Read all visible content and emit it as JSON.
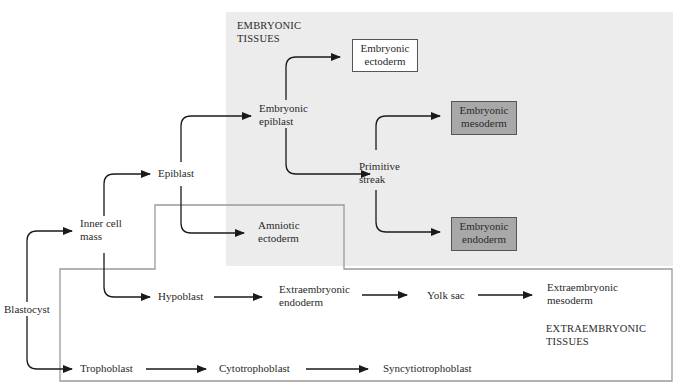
{
  "regions": {
    "embryonic": {
      "title_line1": "EMBRYONIC",
      "title_line2": "TISSUES",
      "color": "#ececec"
    },
    "extraembryonic": {
      "title_line1": "EXTRAEMBRYONIC",
      "title_line2": "TISSUES",
      "border_color": "#9a9a9a"
    }
  },
  "nodes": {
    "blastocyst": "Blastocyst",
    "inner_cell_mass": [
      "Inner cell",
      "mass"
    ],
    "trophoblast": "Trophoblast",
    "epiblast": "Epiblast",
    "hypoblast": "Hypoblast",
    "embryonic_epiblast": [
      "Embryonic",
      "epiblast"
    ],
    "amniotic_ectoderm": [
      "Amniotic",
      "ectoderm"
    ],
    "embryonic_ectoderm": [
      "Embryonic",
      "ectoderm"
    ],
    "primitive_streak": [
      "Primitive",
      "streak"
    ],
    "embryonic_mesoderm": [
      "Embryonic",
      "mesoderm"
    ],
    "embryonic_endoderm": [
      "Embryonic",
      "endoderm"
    ],
    "extraembryonic_endoderm": [
      "Extraembryonic",
      "endoderm"
    ],
    "yolk_sac": "Yolk sac",
    "extraembryonic_mesoderm": [
      "Extraembryonic",
      "mesoderm"
    ],
    "cytotrophoblast": "Cytotrophoblast",
    "syncytiotrophoblast": "Syncytiotrophoblast"
  },
  "box_colors": {
    "white": "#ffffff",
    "gray": "#a8a8a8"
  }
}
